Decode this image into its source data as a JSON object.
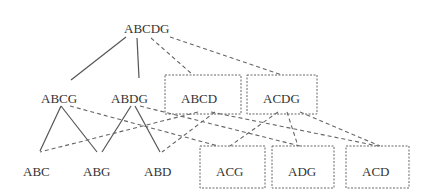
{
  "diagram": {
    "type": "lattice",
    "nodes": [
      {
        "id": "ABCDG",
        "label": "ABCDG",
        "level": 0,
        "boxed": false
      },
      {
        "id": "ABCG",
        "label": "ABCG",
        "level": 1,
        "boxed": false
      },
      {
        "id": "ABDG",
        "label": "ABDG",
        "level": 1,
        "boxed": false
      },
      {
        "id": "ABCD",
        "label": "ABCD",
        "level": 1,
        "boxed": true
      },
      {
        "id": "ACDG",
        "label": "ACDG",
        "level": 1,
        "boxed": true
      },
      {
        "id": "ABC",
        "label": "ABC",
        "level": 2,
        "boxed": false
      },
      {
        "id": "ABG",
        "label": "ABG",
        "level": 2,
        "boxed": false
      },
      {
        "id": "ABD",
        "label": "ABD",
        "level": 2,
        "boxed": false
      },
      {
        "id": "ACG",
        "label": "ACG",
        "level": 2,
        "boxed": true
      },
      {
        "id": "ADG",
        "label": "ADG",
        "level": 2,
        "boxed": true
      },
      {
        "id": "ACD",
        "label": "ACD",
        "level": 2,
        "boxed": true
      }
    ],
    "edges_solid": [
      [
        "ABCDG",
        "ABCG"
      ],
      [
        "ABCDG",
        "ABDG"
      ],
      [
        "ABCG",
        "ABC"
      ],
      [
        "ABCG",
        "ABG"
      ],
      [
        "ABDG",
        "ABG"
      ],
      [
        "ABDG",
        "ABD"
      ]
    ],
    "edges_dashed": [
      [
        "ABCDG",
        "ABCD"
      ],
      [
        "ABCDG",
        "ACDG"
      ],
      [
        "ABCG",
        "ACG"
      ],
      [
        "ABDG",
        "ADG"
      ],
      [
        "ABCD",
        "ABC"
      ],
      [
        "ABCD",
        "ABD"
      ],
      [
        "ABCD",
        "ACD"
      ],
      [
        "ACDG",
        "ACG"
      ],
      [
        "ACDG",
        "ADG"
      ],
      [
        "ACDG",
        "ACD"
      ]
    ]
  }
}
